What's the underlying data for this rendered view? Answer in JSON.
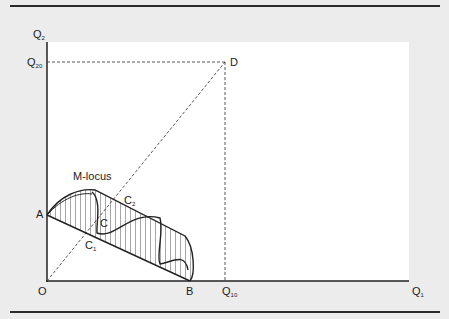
{
  "diagram": {
    "axes": {
      "y_label": "Q",
      "y_label_sub": "2",
      "x_label": "Q",
      "x_label_sub": "1",
      "origin_label": "O"
    },
    "ticks": {
      "q20_label": "Q",
      "q20_sub": "20",
      "q10_label": "Q",
      "q10_sub": "10"
    },
    "points": {
      "A": "A",
      "B": "B",
      "D": "D",
      "C": "C",
      "C1": "C",
      "C1_sub": "1",
      "C2": "C",
      "C2_sub": "2"
    },
    "annotations": {
      "m_locus": "M-locus"
    },
    "colors": {
      "background": "#ececec",
      "plot": "#ffffff",
      "line": "#222222"
    }
  }
}
